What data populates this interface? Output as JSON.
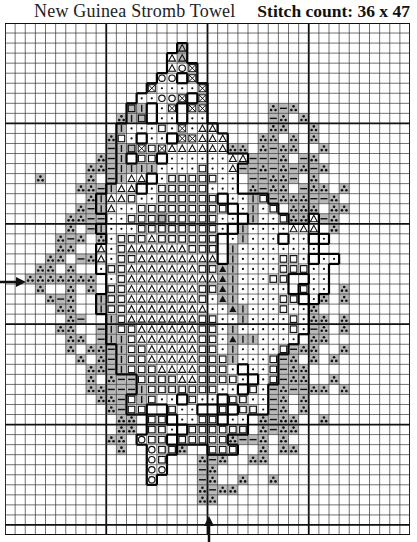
{
  "header": {
    "title": "New Guinea Stromb Towel",
    "stitch_count": "Stitch count: 36 x 47"
  },
  "chart": {
    "cols": 40,
    "rows": 51,
    "major_every": 10,
    "center_markers": {
      "left_arrow_row": 25,
      "bottom_arrow_col": 20
    },
    "colors": {
      "line": "#333333",
      "major_line": "#111111",
      "shade": "#b8b8b8",
      "outline": "#000000"
    },
    "legend": {
      ".": "empty",
      "t": "three-dot (shaded)",
      "-": "dash (shaded)",
      "|": "bar (shaded)",
      "s": "square (shaded)",
      "q": "square (white)",
      "o": "circle",
      "x": "cross",
      "a": "triangle (white)",
      "A": "triangle (shaded)",
      "f": "filled triangle",
      "d": "dot (white)"
    },
    "pattern": [
      "........................................",
      "........................................",
      ".................A......................",
      "................aA......................",
      "................aox.....................",
      "...............oo.x.....................",
      "..............xddddx....................",
      ".............ddoox.x....................",
      "............s|.dx.xx......t-t...........",
      "...........t|s.dd.dd......-t.t..........",
      "...........|dddqdxdaa.....tt..t.........",
      "..........tqd.dd.xxaaa...tt.t.t.........",
      "..........-|sxqxaaaaaatt.t-tt..t........",
      ".........t-|.qq.ddddddaa---t.-t.........",
      "........tt-||||ddddqdda--t-t-t-t........",
      "...t....t.-|aa.dqqqqqdd.--tt-.t.........",
      ".......tt-|aa.dqqqqqddd.t-tt.-tt.t......",
      "........t|aaqddqqqqqq.dd|q-ttt--t.......",
      ".......t-|addqqqqqqqqq.d|dq.ttt.tt......",
      "......tt--ddqqqsqqqqqdd.|ddqtta-t.......",
      "......t.-|dddqqqqqqqqd.|ddddaaa.t.......",
      ".....t-t.tdqqqaqqqqqq.d|ddd.dd.d........",
      ".....tt..adqaaaaaaqqq.|dddddddd.........",
      "....tt.-tadqqaaaaaaaa.|ddddqqd.dd.......",
      "...tt.t..dqqaaaaaaaqqf|ddddqqqdd........",
      "..ttttttt.dqaaaaaaaaaf|dddqq..dd........",
      "...t..t.t.qqaaaaaaaqqf|ddddd.qdd.t......",
      "....t-t..|qqaaaaaaaqdf|ddddqq.dt.t......",
      ".....tt..|qqaaaaaaaaddf|dddqddt.........",
      "......t-..|qaaaaaaaqqdd|ddddqdtt.t......",
      ".....tt..-|qqaaaaaaqqd|dddddqd-t.t......",
      "......tt.-||qaaaaaaqqdf||dddd.tt........",
      "......t.tt-|qqaaaaaqqd|ddddq-tt..t......",
      ".......t.t-|qqaaaaaqqq|dddq-t.t.t.......",
      "........tt-|qqqaaaaqqqd.ddq-tt..........",
      "........t.t--qqqqaaqqqqd.dq-tt..t.......",
      "........tt---|qqqqqqqdd.qd-t--tt.t......",
      ".........tt-q|qdd.qdd.qqdd-t.t..........",
      "..........t-qq..qdd..q.qqd-t.t..........",
      "...........tt.qq.ddqq.dd.t-tt..t........",
      "...........tt.qqd.qqqqqq.t-tt...........",
      "..........tt.oqq.qqqqqt--t.t............",
      "...........t..oqqt..qqq..t.tt...........",
      "..............oq...t-t..tt..............",
      "..............oo...-t...................",
      "..............o....-t..t..t.............",
      "...................t-tt.................",
      "...................tt...................",
      "........................................",
      "........................................",
      "........................................"
    ]
  }
}
